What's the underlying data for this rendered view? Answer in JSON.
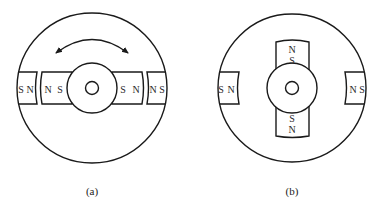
{
  "figure_a": {
    "caption": "(a)",
    "stator_left": {
      "outer": "S",
      "inner": "N"
    },
    "rotor_left": {
      "outer": "N",
      "inner": "S"
    },
    "rotor_right": {
      "inner": "S",
      "outer": "N"
    },
    "stator_right": {
      "inner": "N",
      "outer": "S"
    },
    "rotation_arrow": "double-headed-arc"
  },
  "figure_b": {
    "caption": "(b)",
    "stator_left": {
      "outer": "S",
      "inner": "N"
    },
    "stator_right": {
      "inner": "N",
      "outer": "S"
    },
    "rotor_top": {
      "outer": "N",
      "inner": "S"
    },
    "rotor_bottom": {
      "inner": "S",
      "outer": "N"
    }
  },
  "colors": {
    "line": "#1a1a1a",
    "text": "#2a2a2a",
    "background": "#ffffff"
  }
}
